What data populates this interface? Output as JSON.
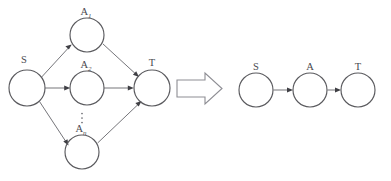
{
  "figure": {
    "caption": "",
    "background_color": "#ffffff",
    "stroke_color": "#5a5a5e",
    "edge_color": "#6e6e73",
    "label_color": "#4a4a4f",
    "transform_arrow": {
      "name": "implies-block-arrow",
      "direction": "right",
      "fill": "#ffffff",
      "stroke": "#8d8d93"
    },
    "left_graph": {
      "name": "parallel-paths-graph",
      "nodes": [
        {
          "id": "S",
          "label": "S",
          "sub": "",
          "cx": 27,
          "cy": 88,
          "r": 18
        },
        {
          "id": "A1",
          "label": "A",
          "sub": "1",
          "cx": 87,
          "cy": 35,
          "r": 17
        },
        {
          "id": "A2",
          "label": "A",
          "sub": "2",
          "cx": 87,
          "cy": 88,
          "r": 17
        },
        {
          "id": "An",
          "label": "A",
          "sub": "n",
          "cx": 82,
          "cy": 152,
          "r": 17
        },
        {
          "id": "T",
          "label": "T",
          "sub": "",
          "cx": 152,
          "cy": 88,
          "r": 18
        }
      ],
      "edges": [
        {
          "from": "S",
          "to": "A1"
        },
        {
          "from": "S",
          "to": "A2"
        },
        {
          "from": "S",
          "to": "An"
        },
        {
          "from": "A1",
          "to": "T"
        },
        {
          "from": "A2",
          "to": "T"
        },
        {
          "from": "An",
          "to": "T"
        }
      ],
      "ellipsis": {
        "name": "vertical-ellipsis",
        "glyph": "⋮",
        "x": 82,
        "y": 118,
        "dots": 3
      }
    },
    "right_graph": {
      "name": "single-path-graph",
      "nodes": [
        {
          "id": "S",
          "label": "S",
          "sub": "",
          "cx": 256,
          "cy": 90,
          "r": 17
        },
        {
          "id": "A",
          "label": "A",
          "sub": "",
          "cx": 310,
          "cy": 90,
          "r": 17
        },
        {
          "id": "T",
          "label": "T",
          "sub": "",
          "cx": 358,
          "cy": 90,
          "r": 17
        }
      ],
      "edges": [
        {
          "from": "S",
          "to": "A"
        },
        {
          "from": "A",
          "to": "T"
        }
      ]
    }
  }
}
